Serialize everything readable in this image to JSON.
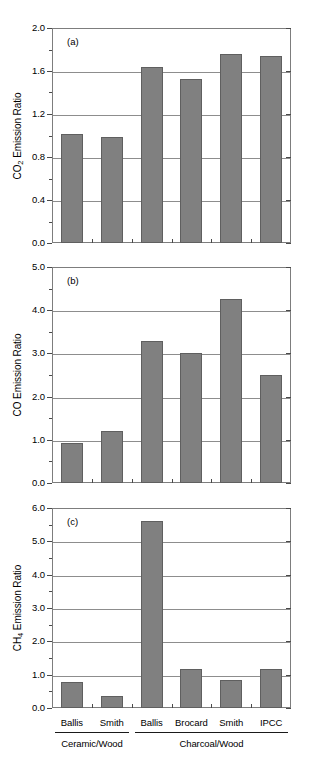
{
  "figure": {
    "background": "#ffffff",
    "bar_color": "#808080",
    "bar_edge_color": "#5f5f5f",
    "grid_color": "#8d8d8d",
    "axis_color": "#7d7d7d"
  },
  "categories": [
    "Ballis",
    "Smith",
    "Ballis",
    "Brocard",
    "Smith",
    "IPCC"
  ],
  "groups": [
    {
      "label": "Ceramic/Wood",
      "span": [
        0,
        1
      ]
    },
    {
      "label": "Charcoal/Wood",
      "span": [
        2,
        5
      ]
    }
  ],
  "panels": [
    {
      "tag": "(a)",
      "ylabel_prefix": "CO",
      "ylabel_sub": "2",
      "ylabel_suffix": " Emission Ratio",
      "ylabel_plain": "CO2 Emission Ratio",
      "yticks": [
        "0.0",
        "0.4",
        "0.8",
        "1.2",
        "1.6",
        "2.0"
      ],
      "ylim": [
        0,
        2.0
      ],
      "tick_step": 0.4,
      "minor_step": 0.2,
      "values": [
        1.01,
        0.99,
        1.64,
        1.53,
        1.76,
        1.74
      ]
    },
    {
      "tag": "(b)",
      "ylabel_prefix": "CO",
      "ylabel_sub": "",
      "ylabel_suffix": " Emission Ratio",
      "ylabel_plain": "CO Emission Ratio",
      "yticks": [
        "0.0",
        "1.0",
        "2.0",
        "3.0",
        "4.0",
        "5.0"
      ],
      "ylim": [
        0,
        5.0
      ],
      "tick_step": 1.0,
      "minor_step": 0.5,
      "values": [
        0.93,
        1.21,
        3.28,
        3.01,
        4.25,
        2.49
      ]
    },
    {
      "tag": "(c)",
      "ylabel_prefix": "CH",
      "ylabel_sub": "4",
      "ylabel_suffix": " Emission Ratio",
      "ylabel_plain": "CH4 Emission Ratio",
      "yticks": [
        "0.0",
        "1.0",
        "2.0",
        "3.0",
        "4.0",
        "5.0",
        "6.0"
      ],
      "ylim": [
        0,
        6.0
      ],
      "tick_step": 1.0,
      "minor_step": 0.5,
      "values": [
        0.79,
        0.36,
        5.62,
        1.18,
        0.84,
        1.18
      ]
    }
  ],
  "chart_data": {
    "type": "bar",
    "title": "",
    "xlabel": "",
    "categories": [
      "Ballis",
      "Smith",
      "Ballis",
      "Brocard",
      "Smith",
      "IPCC"
    ],
    "group_labels": [
      "Ceramic/Wood",
      "Ceramic/Wood",
      "Charcoal/Wood",
      "Charcoal/Wood",
      "Charcoal/Wood",
      "Charcoal/Wood"
    ],
    "grid": true,
    "legend": "none",
    "panels": [
      {
        "panel": "(a)",
        "ylabel": "CO2 Emission Ratio",
        "ylim": [
          0,
          2.0
        ],
        "yticks": [
          0.0,
          0.4,
          0.8,
          1.2,
          1.6,
          2.0
        ],
        "values": [
          1.01,
          0.99,
          1.64,
          1.53,
          1.76,
          1.74
        ]
      },
      {
        "panel": "(b)",
        "ylabel": "CO Emission Ratio",
        "ylim": [
          0,
          5.0
        ],
        "yticks": [
          0.0,
          1.0,
          2.0,
          3.0,
          4.0,
          5.0
        ],
        "values": [
          0.93,
          1.21,
          3.28,
          3.01,
          4.25,
          2.49
        ]
      },
      {
        "panel": "(c)",
        "ylabel": "CH4 Emission Ratio",
        "ylim": [
          0,
          6.0
        ],
        "yticks": [
          0.0,
          1.0,
          2.0,
          3.0,
          4.0,
          5.0,
          6.0
        ],
        "values": [
          0.79,
          0.36,
          5.62,
          1.18,
          0.84,
          1.18
        ]
      }
    ]
  }
}
